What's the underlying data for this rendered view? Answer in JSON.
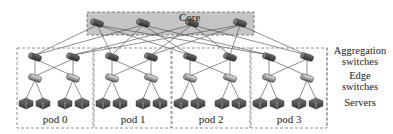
{
  "diagram": {
    "type": "fat-tree network topology (k=4)",
    "core": {
      "label": "Core",
      "switch_count": 4,
      "box": {
        "x": 87,
        "y": 12,
        "w": 167,
        "h": 23,
        "fill": "#c4c4c4",
        "stroke": "#666666"
      },
      "switches_x": [
        97,
        143,
        192,
        240
      ],
      "switches_y": 23
    },
    "layers": [
      {
        "id": "aggregation",
        "label_line1": "Aggregation",
        "label_line2": "switches"
      },
      {
        "id": "edge",
        "label_line1": "Edge",
        "label_line2": "switches"
      },
      {
        "id": "servers",
        "label_line1": "Servers",
        "label_line2": ""
      }
    ],
    "pods": [
      {
        "label": "pod 0",
        "x": 17,
        "w": 76
      },
      {
        "label": "pod 1",
        "x": 94,
        "w": 77
      },
      {
        "label": "pod 2",
        "x": 172,
        "w": 78
      },
      {
        "label": "pod 3",
        "x": 251,
        "w": 76
      }
    ],
    "pod_box": {
      "y": 48,
      "h": 80,
      "stroke": "#777777"
    },
    "rows_y": {
      "aggregation": 57,
      "edge": 78,
      "servers": 103,
      "pod_label": 118
    },
    "colors": {
      "agg_switch": "#4a4a4a",
      "edge_switch": "#8a8a8a",
      "server": "#555555",
      "link": "#444444",
      "core_fill": "#c4c4c4"
    }
  }
}
